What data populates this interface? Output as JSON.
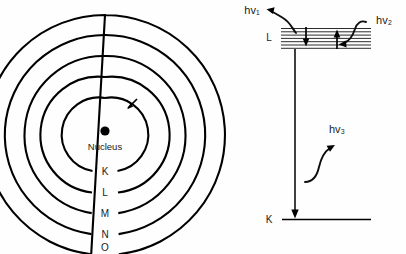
{
  "figure": {
    "background_color": "#fefefe",
    "ink_color": "#000000",
    "panels": [
      "bohr-atom-model",
      "energy-level-diagram"
    ]
  },
  "atom_model": {
    "nucleus_label": "Nucleus",
    "center": {
      "x": 105,
      "y": 135
    },
    "shells": [
      {
        "label": "K",
        "radius": 37
      },
      {
        "label": "L",
        "radius": 58
      },
      {
        "label": "M",
        "radius": 79
      },
      {
        "label": "N",
        "radius": 100
      },
      {
        "label": "O",
        "radius": 120
      }
    ],
    "electron_arrow": {
      "description": "inward-pointing arrow on K shell"
    }
  },
  "energy_diagram": {
    "levels": [
      {
        "label": "L",
        "y": 38,
        "sublevel_count": 7
      },
      {
        "label": "K",
        "y": 219,
        "sublevel_count": 1
      }
    ],
    "photons": [
      {
        "label": "hv₁",
        "kind": "emission",
        "x": 252,
        "y": 12
      },
      {
        "label": "hv₂",
        "kind": "absorption",
        "x": 376,
        "y": 22
      },
      {
        "label": "hv₃",
        "kind": "emission",
        "x": 337,
        "y": 130
      }
    ],
    "transitions": [
      {
        "from": "L",
        "to": "K",
        "direction": "down"
      },
      {
        "from": "L-sub",
        "to": "L-lower",
        "direction": "down"
      },
      {
        "from": "L-lower",
        "to": "L-sub",
        "direction": "up"
      }
    ]
  }
}
